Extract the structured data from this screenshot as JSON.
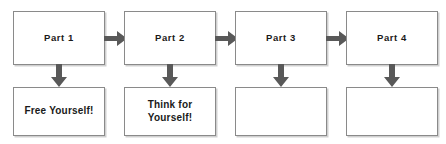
{
  "diagram": {
    "colors": {
      "box_border": "#8a8a8a",
      "box_fill": "#ffffff",
      "arrow": "#595959",
      "text": "#1a1a1a",
      "background": "#ffffff"
    },
    "columns": [
      {
        "index": 1,
        "top_box": {
          "label": "Part 1"
        },
        "bottom_box": {
          "label": "Free Yourself!"
        },
        "down_arrow": {
          "icon": "arrow-down-icon"
        },
        "right_arrow": {
          "icon": "arrow-right-icon"
        }
      },
      {
        "index": 2,
        "top_box": {
          "label": "Part 2"
        },
        "bottom_box": {
          "label": "Think for Yourself!"
        },
        "down_arrow": {
          "icon": "arrow-down-icon"
        },
        "right_arrow": {
          "icon": "arrow-right-icon"
        }
      },
      {
        "index": 3,
        "top_box": {
          "label": "Part 3"
        },
        "bottom_box": {
          "label": ""
        },
        "down_arrow": {
          "icon": "arrow-down-icon"
        },
        "right_arrow": {
          "icon": "arrow-right-icon"
        }
      },
      {
        "index": 4,
        "top_box": {
          "label": "Part 4"
        },
        "bottom_box": {
          "label": ""
        },
        "down_arrow": {
          "icon": "arrow-down-icon"
        },
        "right_arrow": null
      }
    ]
  }
}
